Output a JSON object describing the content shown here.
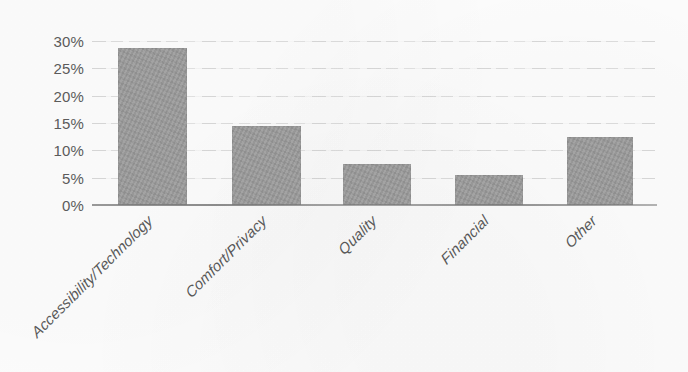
{
  "chart_data": {
    "type": "bar",
    "title": "",
    "subtitle": "",
    "xlabel": "",
    "ylabel": "",
    "categories": [
      "Accessibility/Technology",
      "Comfort/Privacy",
      "Quality",
      "Financial",
      "Other"
    ],
    "values": [
      28.2,
      14.2,
      7.4,
      5.4,
      12.3
    ],
    "ylim": [
      0,
      30
    ],
    "ytick_labels": [
      "30%",
      "25%",
      "20%",
      "15%",
      "10%",
      "5%",
      "0%"
    ],
    "ytick_values": [
      30,
      25,
      20,
      15,
      10,
      5,
      0
    ],
    "value_format": "percent",
    "grid": true,
    "grid_axis": "y",
    "legend": false,
    "legend_position": "none",
    "bar_color": "#9a9a9a",
    "axis_color": "#787878",
    "text_color": "#585858",
    "background_color": "#fdfdfd",
    "xtick_label_rotation": -45
  }
}
